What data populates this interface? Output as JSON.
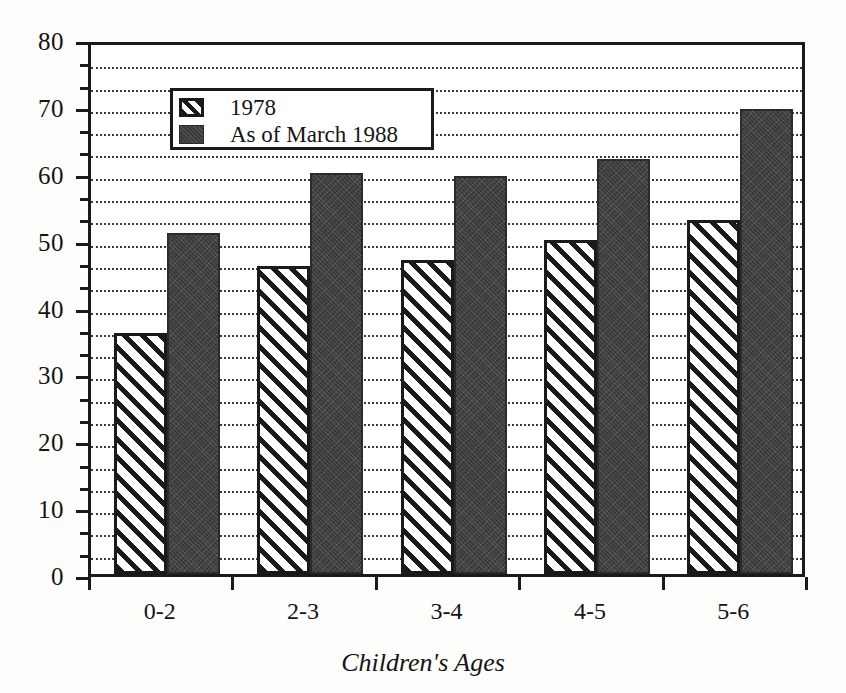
{
  "chart_data": {
    "type": "bar",
    "title": "",
    "subtitle": "",
    "xlabel": "Children's Ages",
    "ylabel": "",
    "categories": [
      "0-2",
      "2-3",
      "3-4",
      "4-5",
      "5-6"
    ],
    "series": [
      {
        "name": "1978",
        "values": [
          36,
          46,
          47,
          50,
          53
        ],
        "pattern": "diagonal-hatch",
        "color": "#ffffff"
      },
      {
        "name": "As of March 1988",
        "values": [
          51,
          60,
          59.5,
          62,
          69.5
        ],
        "pattern": "solid-dark",
        "color": "#3a3a3a"
      }
    ],
    "ylim": [
      0,
      80
    ],
    "y_major_ticks": [
      0,
      10,
      20,
      30,
      40,
      50,
      60,
      70,
      80
    ],
    "y_tick_labels": [
      "0",
      "10",
      "20",
      "30",
      "40",
      "50",
      "60",
      "70",
      "80"
    ],
    "y_minor_interval": 3.3333,
    "grid": "horizontal-dotted",
    "legend_position": "upper-left-inside",
    "frame": "box"
  },
  "legend": {
    "entries": [
      {
        "label": "1978",
        "swatch": "hatched-swatch-icon"
      },
      {
        "label": "As of March 1988",
        "swatch": "solid-dark-swatch-icon"
      }
    ]
  },
  "axes": {
    "x": {
      "title": "Children's Ages",
      "tick_labels": [
        "0-2",
        "2-3",
        "3-4",
        "4-5",
        "5-6"
      ]
    },
    "y": {
      "title": "",
      "tick_labels": [
        "0",
        "10",
        "20",
        "30",
        "40",
        "50",
        "60",
        "70",
        "80"
      ]
    }
  }
}
